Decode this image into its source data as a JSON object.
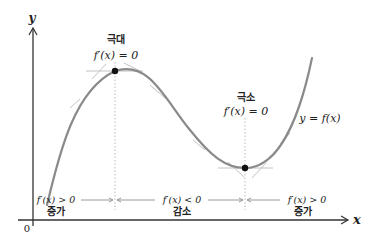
{
  "diagram": {
    "axes": {
      "x_label": "x",
      "y_label": "y",
      "origin_label": "0"
    },
    "curve_label": "y = f(x)",
    "local_max": {
      "title": "극대",
      "condition": "f′(x) = 0"
    },
    "local_min": {
      "title": "극소",
      "condition": "f′(x) = 0"
    },
    "intervals": [
      {
        "condition": "f′(x) > 0",
        "behavior": "증가"
      },
      {
        "condition": "f′(x) < 0",
        "behavior": "감소"
      },
      {
        "condition": "f′(x) > 0",
        "behavior": "증가"
      }
    ],
    "colors": {
      "curve": "#8a8a8a",
      "tangent": "#bdbdbd",
      "axis": "#333333",
      "point": "#111111",
      "guide": "#b5b5b5",
      "text": "#222222"
    }
  }
}
